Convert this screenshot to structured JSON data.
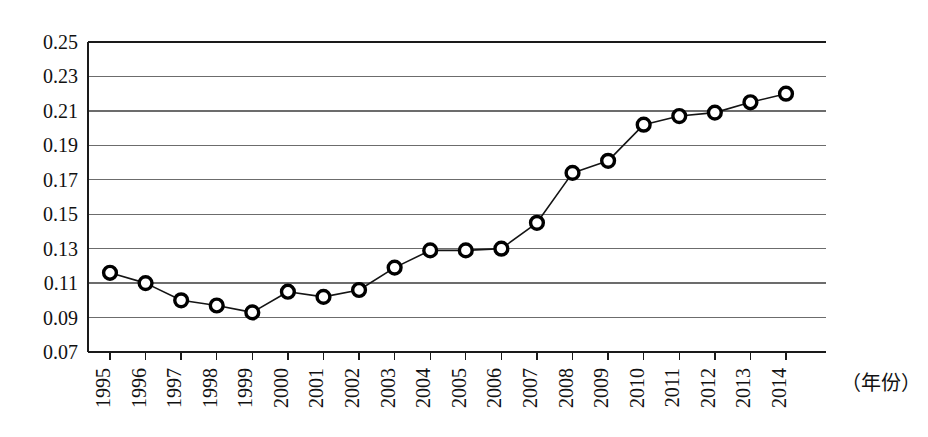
{
  "chart_data": {
    "type": "line",
    "title": "",
    "subtitle": "",
    "xlabel": "（年份）",
    "ylabel": "",
    "categories": [
      "1995",
      "1996",
      "1997",
      "1998",
      "1999",
      "2000",
      "2001",
      "2002",
      "2003",
      "2004",
      "2005",
      "2006",
      "2007",
      "2008",
      "2009",
      "2010",
      "2011",
      "2012",
      "2013",
      "2014"
    ],
    "x": [
      1995,
      1996,
      1997,
      1998,
      1999,
      2000,
      2001,
      2002,
      2003,
      2004,
      2005,
      2006,
      2007,
      2008,
      2009,
      2010,
      2011,
      2012,
      2013,
      2014
    ],
    "values": [
      0.116,
      0.11,
      0.1,
      0.097,
      0.093,
      0.105,
      0.102,
      0.106,
      0.119,
      0.129,
      0.129,
      0.13,
      0.145,
      0.174,
      0.181,
      0.202,
      0.207,
      0.209,
      0.215,
      0.22
    ],
    "series": [
      {
        "name": "",
        "values": [
          0.116,
          0.11,
          0.1,
          0.097,
          0.093,
          0.105,
          0.102,
          0.106,
          0.119,
          0.129,
          0.129,
          0.13,
          0.145,
          0.174,
          0.181,
          0.202,
          0.207,
          0.209,
          0.215,
          0.22
        ]
      }
    ],
    "ylim": [
      0.07,
      0.25
    ],
    "xlim": [
      1995,
      2014
    ],
    "yticks": [
      0.07,
      0.09,
      0.11,
      0.13,
      0.15,
      0.17,
      0.19,
      0.21,
      0.23,
      0.25
    ],
    "ytick_labels": [
      "0.07",
      "0.09",
      "0.11",
      "0.13",
      "0.15",
      "0.17",
      "0.19",
      "0.21",
      "0.23",
      "0.25"
    ],
    "ytick_step": 0.02,
    "grid": true,
    "grid_axis": "y",
    "legend": false,
    "legend_position": "none",
    "marker": "open-circle",
    "line_color": "#141414",
    "marker_fill": "#ffffff",
    "marker_stroke": "#000000",
    "grid_color": "#6c6c6c",
    "background_color": "#ffffff",
    "xtick_label_rotation": -90,
    "annotations": []
  },
  "axis_caption": {
    "text": "（年份）"
  }
}
